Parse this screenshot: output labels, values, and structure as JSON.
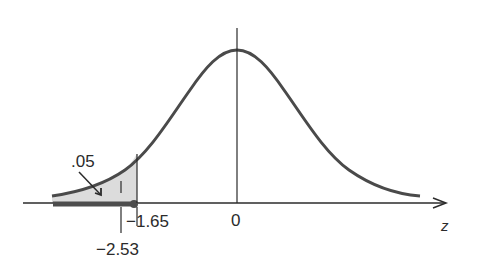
{
  "diagram": {
    "type": "normal-distribution-left-tail",
    "axis_label": "z",
    "tick_labels": {
      "zero": "0",
      "critical": "−1.65",
      "observed": "−2.53"
    },
    "area_label": ".05",
    "colors": {
      "curve": "#4a4a4a",
      "shade": "#d9d9d9",
      "rejection_bar": "#4d4d4d",
      "axis": "#2b2b2b"
    }
  }
}
